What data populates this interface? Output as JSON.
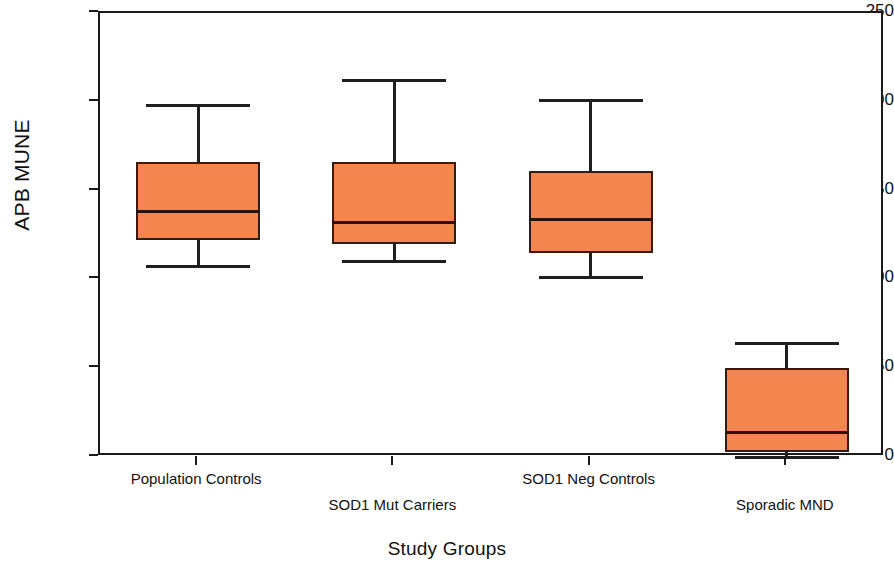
{
  "chart_data": {
    "type": "box",
    "title": "",
    "xlabel": "Study Groups",
    "ylabel": "APB MUNE",
    "ylim": [
      0,
      250
    ],
    "ytick_labels": [
      "250",
      "200",
      "150",
      "100",
      "50",
      "0"
    ],
    "ytick_values": [
      250,
      200,
      150,
      100,
      50,
      0
    ],
    "grid": false,
    "legend": "none",
    "box_fill_color": "#F5854F",
    "box_edge_color": "#3A1A0E",
    "whisker_color": "#1F1F1F",
    "categories": [
      "Population Controls",
      "SOD1 Mut Carriers",
      "SOD1 Neg Controls",
      "Sporadic MND"
    ],
    "boxes": [
      {
        "label": "Population Controls",
        "whisker_low": 107,
        "q1": 122,
        "median": 138,
        "q3": 166,
        "whisker_high": 198
      },
      {
        "label": "SOD1 Mut Carriers",
        "whisker_low": 110,
        "q1": 120,
        "median": 132,
        "q3": 166,
        "whisker_high": 212
      },
      {
        "label": "SOD1 Neg Controls",
        "whisker_low": 101,
        "q1": 115,
        "median": 134,
        "q3": 161,
        "whisker_high": 201
      },
      {
        "label": "Sporadic MND",
        "whisker_low": 0,
        "q1": 3,
        "median": 14,
        "q3": 50,
        "whisker_high": 64
      }
    ]
  },
  "axis": {
    "y_title": "APB MUNE",
    "x_title": "Study Groups"
  }
}
